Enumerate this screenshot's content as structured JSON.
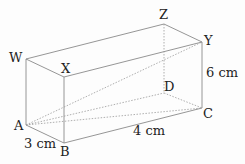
{
  "diagram": {
    "vertices": {
      "W": {
        "label": "W",
        "x": 26,
        "y": 59
      },
      "X": {
        "label": "X",
        "x": 64,
        "y": 77
      },
      "Z": {
        "label": "Z",
        "x": 164,
        "y": 24
      },
      "Y": {
        "label": "Y",
        "x": 202,
        "y": 42
      },
      "A": {
        "label": "A",
        "x": 26,
        "y": 125
      },
      "B": {
        "label": "B",
        "x": 64,
        "y": 143
      },
      "D": {
        "label": "D",
        "x": 164,
        "y": 93
      },
      "C": {
        "label": "C",
        "x": 202,
        "y": 108
      }
    },
    "dimensions": {
      "width": "3 cm",
      "length": "4 cm",
      "height": "6 cm"
    },
    "colors": {
      "edge": "#8a8a8a",
      "hidden": "#9a9a9a",
      "text": "#222222"
    }
  }
}
